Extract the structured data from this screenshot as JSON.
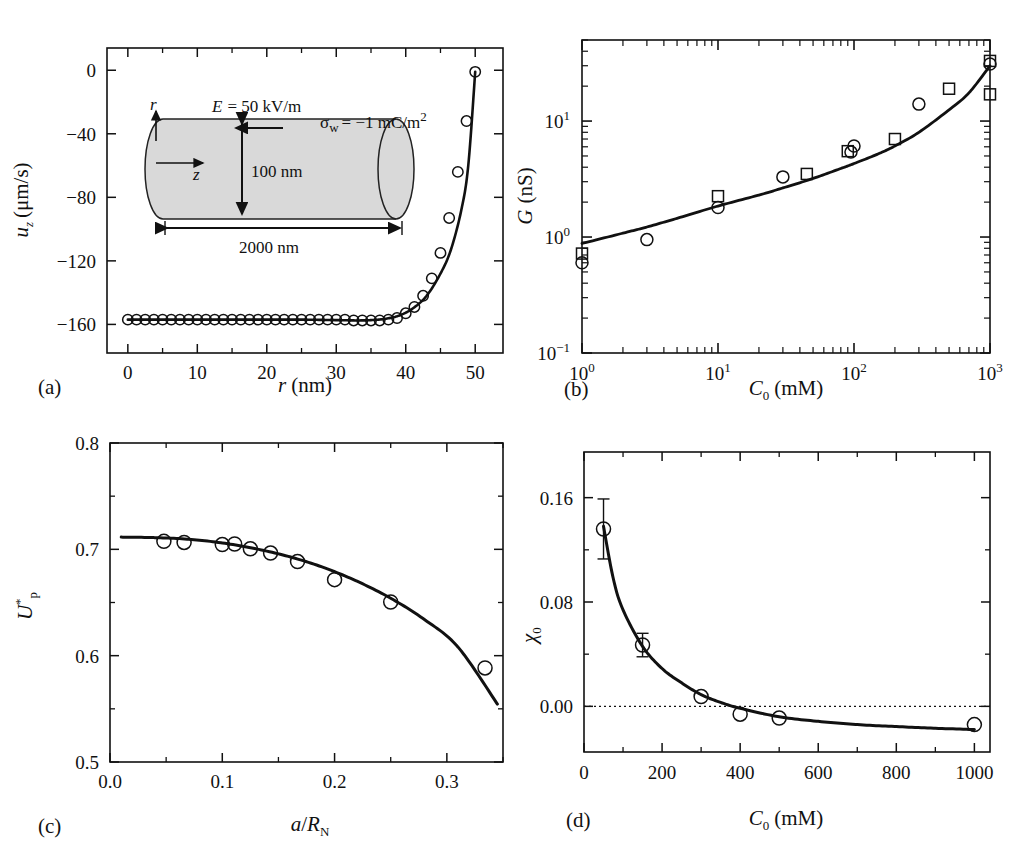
{
  "figure": {
    "panels": [
      "(a)",
      "(b)",
      "(c)",
      "(d)"
    ],
    "background": "#ffffff",
    "ink": "#111111"
  },
  "panel_a": {
    "label": "(a)",
    "xlabel_italic": "r",
    "xlabel_unit": "(nm)",
    "ylabel_main": "u",
    "ylabel_sub": "z",
    "ylabel_unit": "(μm/s)",
    "xticks": [
      "0",
      "10",
      "20",
      "30",
      "40",
      "50"
    ],
    "yticks": [
      "0",
      "−40",
      "−80",
      "−120",
      "−160"
    ],
    "inset": {
      "field_label": "E = 50 kV/m",
      "field_sym": "E",
      "field_val": "= 50 kV/m",
      "sigma_sym": "σ",
      "sigma_sub": "w",
      "sigma_val": "= −1 mC/m",
      "sigma_exp": "2",
      "diameter": "100 nm",
      "length": "2000 nm",
      "axis_r": "r",
      "axis_z": "z",
      "fill": "#d9d9d9"
    }
  },
  "panel_b": {
    "label": "(b)",
    "xlabel_main": "C",
    "xlabel_sub": "0",
    "xlabel_unit": "(mM)",
    "ylabel_main": "G",
    "ylabel_unit": "(nS)",
    "xticks": [
      {
        "base": "10",
        "exp": "0"
      },
      {
        "base": "10",
        "exp": "1"
      },
      {
        "base": "10",
        "exp": "2"
      },
      {
        "base": "10",
        "exp": "3"
      }
    ],
    "yticks": [
      {
        "base": "10",
        "exp": "−1"
      },
      {
        "base": "10",
        "exp": "0"
      },
      {
        "base": "10",
        "exp": "1"
      }
    ]
  },
  "panel_c": {
    "label": "(c)",
    "xlabel_num": "a",
    "xlabel_den_main": "R",
    "xlabel_den_sub": "N",
    "ylabel_main": "U",
    "ylabel_sub": "p",
    "ylabel_sup": "*",
    "xticks": [
      "0.0",
      "0.1",
      "0.2",
      "0.3"
    ],
    "yticks": [
      "0.5",
      "0.6",
      "0.7",
      "0.8"
    ]
  },
  "panel_d": {
    "label": "(d)",
    "xlabel_main": "C",
    "xlabel_sub": "0",
    "xlabel_unit": "(mM)",
    "ylabel_main": "χ",
    "ylabel_sub": "0",
    "xticks": [
      "0",
      "200",
      "400",
      "600",
      "800",
      "1000"
    ],
    "yticks": [
      "0.00",
      "0.08",
      "0.16"
    ],
    "zero_line": "dotted"
  },
  "chart_data": [
    {
      "type": "scatter",
      "panel": "(a)",
      "title": "",
      "xlabel": "r (nm)",
      "ylabel": "u_z (μm/s)",
      "xlim": [
        -3,
        54
      ],
      "ylim": [
        -178,
        14
      ],
      "xticks": [
        0,
        10,
        20,
        30,
        40,
        50
      ],
      "yticks": [
        0,
        -40,
        -80,
        -120,
        -160
      ],
      "grid": false,
      "legend": null,
      "series": [
        {
          "name": "simulation markers",
          "marker": "open-circle",
          "x": [
            0,
            1.25,
            2.5,
            3.75,
            5,
            6.25,
            7.5,
            8.75,
            10,
            11.25,
            12.5,
            13.75,
            15,
            16.25,
            17.5,
            18.75,
            20,
            21.25,
            22.5,
            23.75,
            25,
            26.25,
            27.5,
            28.75,
            30,
            31.25,
            32.5,
            33.75,
            35,
            36.25,
            37.5,
            38.75,
            40,
            41.25,
            42.5,
            43.75,
            45,
            46.25,
            47.5,
            48.75,
            50
          ],
          "y": [
            -157,
            -157,
            -157,
            -157,
            -157,
            -157,
            -157,
            -157,
            -157,
            -157,
            -157,
            -157,
            -157,
            -157,
            -157,
            -157,
            -157,
            -157,
            -157,
            -157,
            -157,
            -157,
            -157,
            -157,
            -157,
            -157,
            -157.5,
            -157.5,
            -157.5,
            -157.5,
            -157,
            -156,
            -153,
            -149,
            -142,
            -131,
            -115,
            -93,
            -64,
            -32,
            -1
          ]
        },
        {
          "name": "theory curve",
          "marker": "line",
          "x": [
            0,
            5,
            10,
            15,
            20,
            25,
            30,
            33,
            35,
            37,
            39,
            41,
            43,
            45,
            46.5,
            48,
            49,
            50
          ],
          "y": [
            -157,
            -157,
            -157,
            -157,
            -157,
            -157,
            -157.3,
            -157.5,
            -157.3,
            -156.5,
            -154.5,
            -150,
            -142,
            -128,
            -113,
            -88,
            -60,
            -1
          ]
        }
      ]
    },
    {
      "type": "scatter",
      "panel": "(b)",
      "title": "",
      "xlabel": "C_0 (mM)",
      "ylabel": "G (nS)",
      "xscale": "log",
      "yscale": "log",
      "xlim": [
        1,
        1000
      ],
      "ylim": [
        0.1,
        50
      ],
      "xticks": [
        1,
        10,
        100,
        1000
      ],
      "yticks": [
        0.1,
        1,
        10
      ],
      "grid": false,
      "series": [
        {
          "name": "circles",
          "marker": "open-circle",
          "x": [
            1.0,
            3.0,
            10.0,
            30.0,
            95.0,
            100.0,
            300.0,
            1000.0
          ],
          "y": [
            0.6,
            0.95,
            1.8,
            3.3,
            5.4,
            6.1,
            14.0,
            31.0
          ]
        },
        {
          "name": "squares",
          "marker": "open-square",
          "x": [
            1.0,
            10.0,
            45.0,
            90.0,
            200.0,
            500.0,
            1000.0,
            1000.0
          ],
          "y": [
            0.72,
            2.25,
            3.5,
            5.5,
            7.0,
            19.0,
            33.0,
            17.0
          ]
        },
        {
          "name": "theory curve",
          "marker": "line",
          "x": [
            1,
            2,
            3,
            5,
            10,
            20,
            30,
            50,
            80,
            100,
            150,
            200,
            300,
            500,
            700,
            1000
          ],
          "y": [
            0.88,
            1.08,
            1.22,
            1.45,
            1.85,
            2.3,
            2.65,
            3.2,
            3.9,
            4.3,
            5.2,
            6.1,
            8.0,
            12.5,
            17.5,
            30.0
          ]
        }
      ]
    },
    {
      "type": "scatter",
      "panel": "(c)",
      "title": "",
      "xlabel": "a/R_N",
      "ylabel": "U_p*",
      "xlim": [
        0.0,
        0.35
      ],
      "ylim": [
        0.5,
        0.8
      ],
      "xticks": [
        0.0,
        0.1,
        0.2,
        0.3
      ],
      "yticks": [
        0.5,
        0.6,
        0.7,
        0.8
      ],
      "grid": false,
      "series": [
        {
          "name": "simulation markers",
          "marker": "open-circle",
          "x": [
            0.048,
            0.066,
            0.1,
            0.111,
            0.125,
            0.143,
            0.167,
            0.2,
            0.25,
            0.334
          ],
          "y": [
            0.7075,
            0.7065,
            0.7045,
            0.705,
            0.7005,
            0.6965,
            0.6885,
            0.6715,
            0.6505,
            0.5885
          ]
        },
        {
          "name": "theory curve",
          "marker": "line",
          "x": [
            0.01,
            0.04,
            0.07,
            0.1,
            0.13,
            0.16,
            0.19,
            0.22,
            0.25,
            0.28,
            0.31,
            0.345
          ],
          "y": [
            0.7115,
            0.711,
            0.7095,
            0.706,
            0.7005,
            0.693,
            0.683,
            0.67,
            0.654,
            0.634,
            0.608,
            0.5545
          ]
        }
      ]
    },
    {
      "type": "scatter",
      "panel": "(d)",
      "title": "",
      "xlabel": "C_0 (mM)",
      "ylabel": "χ_0",
      "xlim": [
        0,
        1040
      ],
      "ylim": [
        -0.035,
        0.195
      ],
      "xticks": [
        0,
        200,
        400,
        600,
        800,
        1000
      ],
      "yticks": [
        0.0,
        0.08,
        0.16
      ],
      "grid": false,
      "zero_reference_line": 0.0,
      "series": [
        {
          "name": "experiment markers",
          "marker": "open-circle",
          "x": [
            50,
            150,
            300,
            400,
            500,
            1000
          ],
          "y": [
            0.136,
            0.047,
            0.0075,
            -0.006,
            -0.009,
            -0.014
          ],
          "yerr": [
            0.023,
            0.009,
            0.0,
            0.0,
            0.0,
            0.0
          ]
        },
        {
          "name": "theory curve",
          "marker": "line",
          "x": [
            50,
            75,
            100,
            150,
            200,
            250,
            300,
            350,
            400,
            500,
            600,
            700,
            800,
            900,
            1000
          ],
          "y": [
            0.138,
            0.098,
            0.074,
            0.046,
            0.029,
            0.018,
            0.009,
            0.003,
            -0.0015,
            -0.008,
            -0.0115,
            -0.014,
            -0.0155,
            -0.0168,
            -0.0178
          ]
        }
      ]
    }
  ]
}
